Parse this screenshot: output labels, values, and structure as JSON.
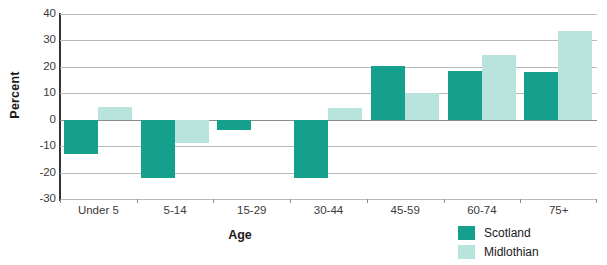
{
  "chart_data": {
    "type": "bar",
    "title": "",
    "xlabel": "Age",
    "ylabel": "Percent",
    "categories": [
      "Under 5",
      "5-14",
      "15-29",
      "30-44",
      "45-59",
      "60-74",
      "75+"
    ],
    "series": [
      {
        "name": "Scotland",
        "color": "#14a08c",
        "values": [
          -13,
          -22,
          -4,
          -22,
          20.5,
          18.5,
          18
        ]
      },
      {
        "name": "Midlothian",
        "color": "#b9e3dd",
        "values": [
          5,
          -9,
          0,
          4.5,
          10,
          24.5,
          33.5
        ]
      }
    ],
    "ylim": [
      -30,
      40
    ],
    "yticks": [
      40,
      30,
      20,
      10,
      0,
      -10,
      -20,
      -30
    ],
    "ytick_labels": [
      "40",
      "30",
      "20",
      "10",
      "0",
      "-10",
      "-20",
      "-30"
    ],
    "grid": true,
    "grid_axis": "y",
    "legend_position": "bottom-right",
    "zero_line": true
  },
  "axes": {
    "y_title": "Percent",
    "x_title": "Age"
  },
  "legend": {
    "entries": [
      {
        "label": "Scotland",
        "swatch": "scotland"
      },
      {
        "label": "Midlothian",
        "swatch": "midlothian"
      }
    ]
  },
  "cropped_title": ""
}
